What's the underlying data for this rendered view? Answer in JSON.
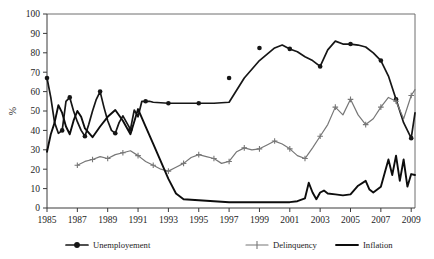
{
  "chart_data": {
    "type": "line",
    "title": "",
    "xlabel": "",
    "ylabel": "%",
    "ylim": [
      0,
      100
    ],
    "xlim": [
      1985,
      2009.25
    ],
    "ytick_labels": [
      "0",
      "10",
      "20",
      "30",
      "40",
      "50",
      "60",
      "70",
      "80",
      "90",
      "100"
    ],
    "ytick_values": [
      0,
      10,
      20,
      30,
      40,
      50,
      60,
      70,
      80,
      90,
      100
    ],
    "xtick_labels": [
      "1985",
      "1987",
      "1989",
      "1991",
      "1993",
      "1995",
      "1997",
      "1999",
      "2001",
      "2003",
      "2005",
      "2007",
      "2009"
    ],
    "xtick_values": [
      1985,
      1987,
      1989,
      1991,
      1993,
      1995,
      1997,
      1999,
      2001,
      2003,
      2005,
      2007,
      2009
    ],
    "grid": false,
    "legend_position": "bottom",
    "series": [
      {
        "name": "Unemployement",
        "color": "#161616",
        "marker": "circle",
        "x": [
          1985.0,
          1985.25,
          1985.5,
          1985.75,
          1986.0,
          1986.25,
          1986.5,
          1986.75,
          1987.0,
          1987.25,
          1987.5,
          1987.75,
          1988.0,
          1988.25,
          1988.5,
          1988.75,
          1989.0,
          1989.25,
          1989.5,
          1989.75,
          1990.0,
          1990.25,
          1990.5,
          1990.75,
          1991.0,
          1991.25,
          1991.5,
          1991.75,
          1992.0,
          1993.0,
          1994.0,
          1995.0,
          1996.0,
          1997.0,
          1998.0,
          1999.0,
          2000.0,
          2000.5,
          2001.0,
          2001.5,
          2002.0,
          2002.5,
          2003.0,
          2003.5,
          2004.0,
          2004.5,
          2005.0,
          2005.5,
          2006.0,
          2006.5,
          2007.0,
          2007.5,
          2008.0,
          2008.5,
          2009.0,
          2009.25
        ],
        "y": [
          67.0,
          57.0,
          44.0,
          38.5,
          40.0,
          55.0,
          57.0,
          50.0,
          44.5,
          40.0,
          37.0,
          43.0,
          50.0,
          56.0,
          60.0,
          52.0,
          45.0,
          40.0,
          38.5,
          44.0,
          47.5,
          44.0,
          40.5,
          50.5,
          47.0,
          55.0,
          55.0,
          55.0,
          54.5,
          54.0,
          54.0,
          54.0,
          54.0,
          54.5,
          67.0,
          76.0,
          82.5,
          84.0,
          82.0,
          80.5,
          78.0,
          76.0,
          73.0,
          81.5,
          86.0,
          84.5,
          84.5,
          84.0,
          83.0,
          80.0,
          76.0,
          68.0,
          56.0,
          44.0,
          36.0,
          49.0
        ],
        "marker_x": [
          1985.0,
          1986.0,
          1986.5,
          1987.5,
          1988.5,
          1989.5,
          1990.5,
          1991.5,
          1993.0,
          1995.0,
          1997.0,
          1999.0,
          2001.0,
          2003.0,
          2005.0,
          2007.0,
          2008.0,
          2009.0
        ],
        "marker_y": [
          67.0,
          40.0,
          57.0,
          37.0,
          60.0,
          38.5,
          40.5,
          55.0,
          54.0,
          54.0,
          67.0,
          82.5,
          82.0,
          73.0,
          84.5,
          76.0,
          56.0,
          36.0
        ]
      },
      {
        "name": "Delinquency",
        "color": "#777777",
        "marker": "plus",
        "x": [
          1987.0,
          1987.5,
          1988.0,
          1988.5,
          1989.0,
          1989.5,
          1990.0,
          1990.5,
          1991.0,
          1991.5,
          1992.0,
          1992.5,
          1993.0,
          1993.5,
          1994.0,
          1994.5,
          1995.0,
          1995.5,
          1996.0,
          1996.5,
          1997.0,
          1997.5,
          1998.0,
          1998.5,
          1999.0,
          1999.5,
          2000.0,
          2000.5,
          2001.0,
          2001.5,
          2002.0,
          2002.5,
          2003.0,
          2003.5,
          2004.0,
          2004.5,
          2005.0,
          2005.5,
          2006.0,
          2006.5,
          2007.0,
          2007.5,
          2008.0,
          2008.5,
          2009.0,
          2009.25
        ],
        "y": [
          22.0,
          24.0,
          25.0,
          26.5,
          25.5,
          27.5,
          28.5,
          29.5,
          27.0,
          24.0,
          22.0,
          20.0,
          19.0,
          21.0,
          23.0,
          26.0,
          27.5,
          26.5,
          25.5,
          23.0,
          24.0,
          29.0,
          31.0,
          30.0,
          30.5,
          32.5,
          34.5,
          33.0,
          30.5,
          27.0,
          25.5,
          31.0,
          37.0,
          43.0,
          52.0,
          48.0,
          56.0,
          48.0,
          43.0,
          46.0,
          52.0,
          57.0,
          55.0,
          46.0,
          58.0,
          61.0
        ],
        "marker_x": [
          1987.0,
          1988.0,
          1989.0,
          1990.0,
          1991.0,
          1992.0,
          1993.0,
          1994.0,
          1995.0,
          1996.0,
          1997.0,
          1998.0,
          1999.0,
          2000.0,
          2001.0,
          2002.0,
          2003.0,
          2004.0,
          2005.0,
          2006.0,
          2007.0,
          2008.0,
          2009.0
        ],
        "marker_y": [
          22.0,
          25.0,
          25.5,
          28.5,
          27.0,
          22.0,
          19.0,
          23.0,
          27.5,
          25.5,
          24.0,
          31.0,
          30.5,
          34.5,
          30.5,
          25.5,
          37.0,
          52.0,
          56.0,
          43.0,
          52.0,
          55.0,
          58.0
        ]
      },
      {
        "name": "Inflation",
        "color": "#0d0d0d",
        "marker": "none",
        "x": [
          1985.0,
          1985.25,
          1985.5,
          1985.75,
          1986.0,
          1986.25,
          1986.5,
          1986.75,
          1987.0,
          1987.25,
          1987.5,
          1988.0,
          1988.5,
          1989.0,
          1989.5,
          1990.0,
          1990.5,
          1991.0,
          1991.5,
          1992.0,
          1992.5,
          1993.0,
          1993.5,
          1994.0,
          1995.0,
          1996.0,
          1997.0,
          1998.0,
          1999.0,
          2000.0,
          2001.0,
          2001.5,
          2002.0,
          2002.25,
          2002.5,
          2002.75,
          2003.0,
          2003.25,
          2003.5,
          2004.0,
          2004.5,
          2005.0,
          2005.5,
          2006.0,
          2006.25,
          2006.5,
          2007.0,
          2007.5,
          2007.75,
          2008.0,
          2008.25,
          2008.5,
          2008.75,
          2009.0,
          2009.25
        ],
        "y": [
          29.0,
          38.0,
          44.0,
          53.0,
          49.0,
          42.0,
          38.0,
          45.0,
          50.0,
          47.0,
          41.0,
          36.5,
          42.0,
          47.0,
          50.5,
          45.0,
          38.0,
          51.0,
          42.0,
          33.0,
          24.0,
          15.0,
          7.5,
          4.5,
          4.0,
          3.5,
          3.0,
          3.0,
          3.0,
          3.0,
          3.0,
          3.5,
          5.0,
          13.0,
          8.0,
          4.5,
          8.0,
          9.0,
          7.5,
          7.0,
          6.5,
          7.0,
          11.5,
          14.0,
          9.5,
          8.0,
          11.0,
          25.0,
          17.0,
          27.0,
          14.0,
          25.0,
          11.0,
          17.5,
          17.0
        ]
      }
    ]
  },
  "axes": {
    "ylabel": "%"
  }
}
